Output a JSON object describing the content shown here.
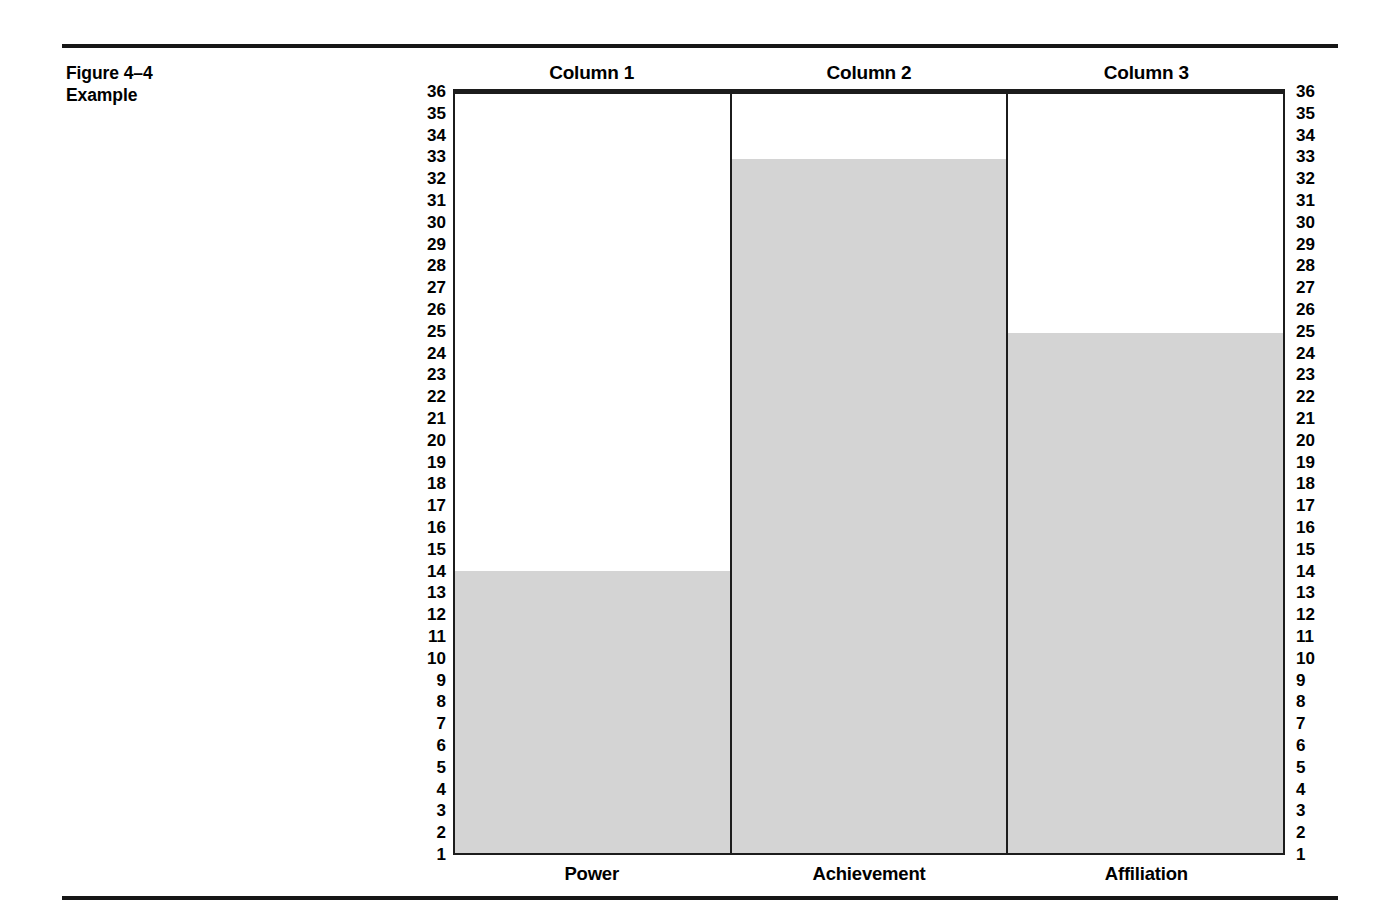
{
  "figure": {
    "label_line1": "Figure 4–4",
    "label_line2": "Example"
  },
  "chart_data": {
    "type": "bar",
    "title": "",
    "xlabel": "",
    "ylabel": "",
    "categories": [
      "Power",
      "Achievement",
      "Affiliation"
    ],
    "column_headers": [
      "Column 1",
      "Column 2",
      "Column 3"
    ],
    "values": [
      14,
      33,
      25
    ],
    "ylim": [
      1,
      36
    ],
    "y_ticks": [
      36,
      35,
      34,
      33,
      32,
      31,
      30,
      29,
      28,
      27,
      26,
      25,
      24,
      23,
      22,
      21,
      20,
      19,
      18,
      17,
      16,
      15,
      14,
      13,
      12,
      11,
      10,
      9,
      8,
      7,
      6,
      5,
      4,
      3,
      2,
      1
    ],
    "grid": false,
    "legend": "none",
    "dual_axis": true,
    "bar_color": "#d4d4d4",
    "frame_color": "#1c1c1c"
  }
}
